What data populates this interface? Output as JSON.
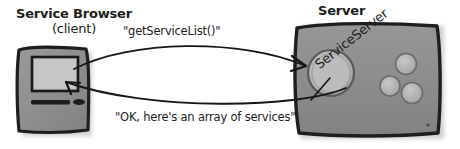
{
  "diagram": {
    "type": "client-server-call-sequence",
    "style": "hand-drawn grayscale illustration",
    "canvas": {
      "width": 460,
      "height": 149,
      "background": "#ffffff"
    },
    "client": {
      "title": "Service Browser",
      "subtitle": "(client)",
      "device_icon": "desktop-computer-icon",
      "body_color": "#8d8d8d",
      "screen_color": "#bdbdbd",
      "outline_color": "#1f1f1f"
    },
    "server": {
      "title": "Server",
      "object_label": "ServiceServer",
      "device_icon": "server-box-icon",
      "body_color": "#8a8a8a",
      "outline_color": "#1f1f1f",
      "big_dial_label": "service-server-dial",
      "small_dial_count": 3
    },
    "messages": [
      {
        "id": "request",
        "text": "\"getServiceList()\"",
        "direction": "client-to-server",
        "arrow_icon": "curved-arrow-right-icon"
      },
      {
        "id": "response",
        "text": "\"OK, here's an array of services\"",
        "direction": "server-to-client",
        "arrow_icon": "curved-arrow-left-icon"
      }
    ],
    "colors": {
      "ink": "#1c1c1c",
      "body": "#8a8a8a",
      "screen": "#bdbdbd",
      "dial": "#ababab",
      "shadow": "#c9c9c9"
    }
  }
}
